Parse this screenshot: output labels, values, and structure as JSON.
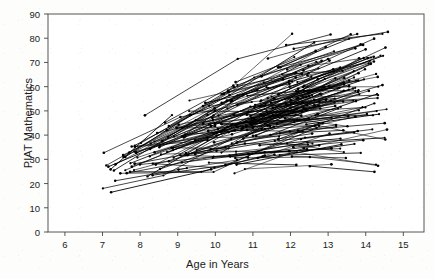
{
  "chart_data": {
    "type": "line",
    "title": "",
    "subtitle": "",
    "xlabel": "Age in Years",
    "ylabel": "PIAT Mathematics",
    "xlim": [
      5.55,
      15.55
    ],
    "ylim": [
      0,
      90
    ],
    "xticks": [
      6,
      7,
      8,
      9,
      10,
      11,
      12,
      13,
      14,
      15
    ],
    "xtick_labels": [
      "6",
      "7",
      "8",
      "9",
      "10",
      "11",
      "12",
      "13",
      "14",
      "15"
    ],
    "yticks": [
      0,
      10,
      20,
      30,
      40,
      50,
      60,
      70,
      80,
      90
    ],
    "ytick_labels": [
      "0",
      "10",
      "20",
      "30",
      "40",
      "50",
      "60",
      "70",
      "80",
      "90"
    ],
    "grid": false,
    "legend": "none",
    "annotations": [],
    "marker": "filled-circle",
    "line_color": "#000000",
    "marker_color": "#000000",
    "series_count": 210,
    "x_data_range": [
      6.8,
      14.6
    ],
    "y_data_range": [
      14,
      83
    ],
    "trend": "increasing",
    "approx_mean_by_age": [
      {
        "age": 7,
        "piat": 25
      },
      {
        "age": 8,
        "piat": 31
      },
      {
        "age": 9,
        "piat": 37
      },
      {
        "age": 10,
        "piat": 43
      },
      {
        "age": 11,
        "piat": 48
      },
      {
        "age": 12,
        "piat": 52
      },
      {
        "age": 13,
        "piat": 56
      },
      {
        "age": 14,
        "piat": 60
      }
    ],
    "approx_spread_by_age": [
      {
        "age": 7,
        "low": 17,
        "high": 37
      },
      {
        "age": 8,
        "low": 17,
        "high": 46
      },
      {
        "age": 9,
        "low": 15,
        "high": 56
      },
      {
        "age": 10,
        "low": 20,
        "high": 64
      },
      {
        "age": 11,
        "low": 24,
        "high": 70
      },
      {
        "age": 12,
        "low": 28,
        "high": 74
      },
      {
        "age": 13,
        "low": 31,
        "high": 79
      },
      {
        "age": 14,
        "low": 33,
        "high": 83
      }
    ]
  },
  "axes": {
    "frame": {
      "left": 48,
      "right": 424,
      "top": 14,
      "bottom": 232
    }
  }
}
